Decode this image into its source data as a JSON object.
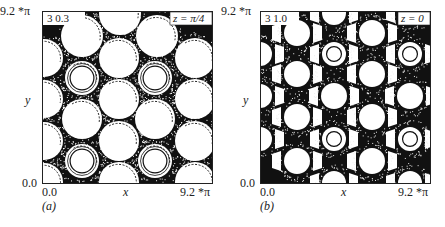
{
  "figure": {
    "panels": [
      {
        "id": "a",
        "caption": "(a)",
        "param_label": "3  0.3",
        "z_label": "z = π/4",
        "y_top": "9.2 *π",
        "y_bottom": "0.0",
        "x_left": "0.0",
        "x_right": "9.2 *π",
        "x_axis": "x",
        "y_axis": "y",
        "style": "bright",
        "islands": [
          {
            "x": 78,
            "y": 3,
            "r": 21,
            "ring": false
          },
          {
            "x": 40,
            "y": 25,
            "r": 21,
            "ring": false
          },
          {
            "x": 115,
            "y": 25,
            "r": 21,
            "ring": false
          },
          {
            "x": 2,
            "y": 47,
            "r": 19,
            "ring": false
          },
          {
            "x": 77,
            "y": 47,
            "r": 20,
            "ring": false
          },
          {
            "x": 153,
            "y": 47,
            "r": 20,
            "ring": false
          },
          {
            "x": 40,
            "y": 67,
            "r": 17,
            "ring": true
          },
          {
            "x": 113,
            "y": 67,
            "r": 17,
            "ring": true
          },
          {
            "x": 2,
            "y": 88,
            "r": 19,
            "ring": false
          },
          {
            "x": 77,
            "y": 88,
            "r": 20,
            "ring": false
          },
          {
            "x": 153,
            "y": 88,
            "r": 20,
            "ring": false
          },
          {
            "x": 40,
            "y": 108,
            "r": 20,
            "ring": false
          },
          {
            "x": 113,
            "y": 108,
            "r": 20,
            "ring": false
          },
          {
            "x": 2,
            "y": 130,
            "r": 19,
            "ring": false
          },
          {
            "x": 77,
            "y": 130,
            "r": 20,
            "ring": false
          },
          {
            "x": 153,
            "y": 130,
            "r": 20,
            "ring": false
          },
          {
            "x": 40,
            "y": 150,
            "r": 17,
            "ring": true
          },
          {
            "x": 113,
            "y": 150,
            "r": 17,
            "ring": true
          },
          {
            "x": 2,
            "y": 171,
            "r": 19,
            "ring": false
          },
          {
            "x": 77,
            "y": 171,
            "r": 20,
            "ring": false
          },
          {
            "x": 153,
            "y": 171,
            "r": 20,
            "ring": false
          }
        ]
      },
      {
        "id": "b",
        "caption": "(b)",
        "param_label": "3  1.0",
        "z_label": "z = 0",
        "y_top": "9.2 *π",
        "y_bottom": "0.0",
        "x_left": "0.0",
        "x_right": "9.2 *π",
        "x_axis": "x",
        "y_axis": "y",
        "style": "dark",
        "islands": [
          {
            "x": 37,
            "y": 22,
            "r": 13,
            "ring": false
          },
          {
            "x": 112,
            "y": 22,
            "r": 13,
            "ring": false
          },
          {
            "x": 0,
            "y": 43,
            "r": 12,
            "ring": false
          },
          {
            "x": 74,
            "y": 43,
            "r": 12,
            "ring": true
          },
          {
            "x": 150,
            "y": 43,
            "r": 12,
            "ring": true
          },
          {
            "x": 37,
            "y": 63,
            "r": 13,
            "ring": false
          },
          {
            "x": 112,
            "y": 63,
            "r": 13,
            "ring": false
          },
          {
            "x": 0,
            "y": 85,
            "r": 12,
            "ring": false
          },
          {
            "x": 74,
            "y": 85,
            "r": 13,
            "ring": false
          },
          {
            "x": 150,
            "y": 85,
            "r": 13,
            "ring": false
          },
          {
            "x": 37,
            "y": 106,
            "r": 13,
            "ring": false
          },
          {
            "x": 112,
            "y": 106,
            "r": 13,
            "ring": false
          },
          {
            "x": 0,
            "y": 128,
            "r": 12,
            "ring": false
          },
          {
            "x": 74,
            "y": 128,
            "r": 12,
            "ring": true
          },
          {
            "x": 150,
            "y": 128,
            "r": 12,
            "ring": true
          },
          {
            "x": 37,
            "y": 150,
            "r": 13,
            "ring": false
          },
          {
            "x": 112,
            "y": 150,
            "r": 13,
            "ring": false
          },
          {
            "x": 74,
            "y": 172,
            "r": 12,
            "ring": false
          },
          {
            "x": 150,
            "y": 172,
            "r": 12,
            "ring": false
          },
          {
            "x": 74,
            "y": 2,
            "r": 12,
            "ring": false
          },
          {
            "x": 150,
            "y": 2,
            "r": 12,
            "ring": false
          }
        ]
      }
    ]
  }
}
